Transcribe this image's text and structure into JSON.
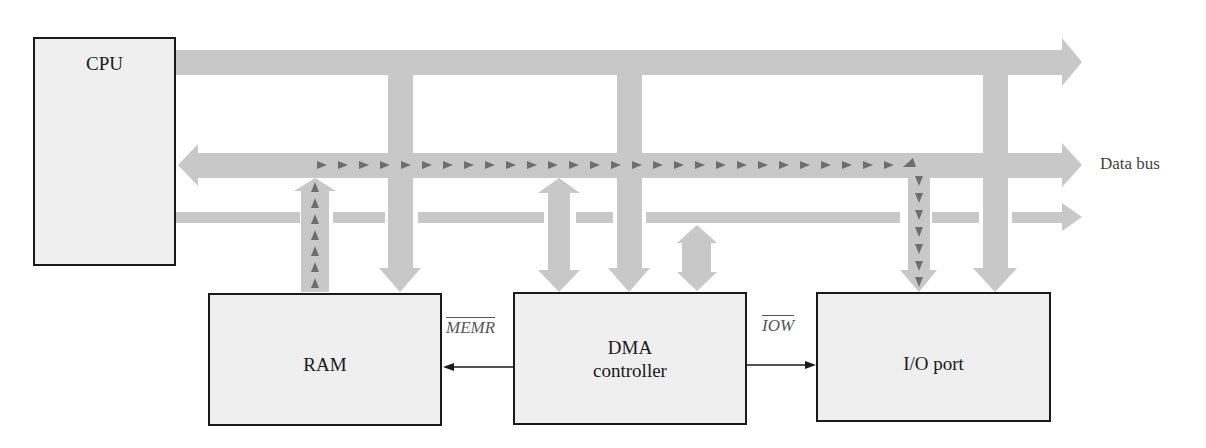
{
  "blocks": {
    "cpu": {
      "label": "CPU"
    },
    "ram": {
      "label": "RAM"
    },
    "dma": {
      "label_line1": "DMA",
      "label_line2": "controller"
    },
    "io": {
      "label": "I/O port"
    }
  },
  "signals": {
    "memr": "MEMR",
    "iow": "IOW"
  },
  "buses": {
    "data_bus_label": "Data bus"
  },
  "colors": {
    "bus": "#c8c8c8",
    "flow_marker": "#6e6e6e",
    "block_fill": "#efefef",
    "block_border": "#1a1a1a"
  }
}
